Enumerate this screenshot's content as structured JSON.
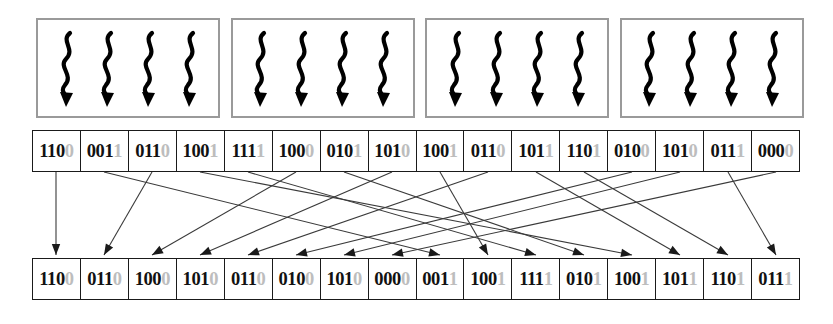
{
  "diagram": {
    "colors": {
      "cell_border": "#1a1a1a",
      "channel_box_border": "#9a9a9a",
      "bit_text": "#111111",
      "faint_bit_text": "#bdbdbd",
      "arrow": "#3a3a3a",
      "background": "#ffffff"
    },
    "channel_boxes": {
      "count": 4,
      "squiggles_per_box": 4,
      "icon": "squiggly-down-arrow-icon"
    },
    "input_row": {
      "label": "input codeword row",
      "cells": [
        "1100",
        "0011",
        "0110",
        "1001",
        "1111",
        "1000",
        "0101",
        "1010",
        "1001",
        "0110",
        "1011",
        "1101",
        "0100",
        "1010",
        "0111",
        "0000"
      ]
    },
    "output_row": {
      "label": "interleaved output row",
      "cells": [
        "1100",
        "0110",
        "1000",
        "1010",
        "0110",
        "0100",
        "1010",
        "0000",
        "0011",
        "1001",
        "1111",
        "0101",
        "1001",
        "1011",
        "1101",
        "0111"
      ]
    },
    "mapping": {
      "label": "source index to destination index",
      "pairs": [
        [
          0,
          0
        ],
        [
          1,
          8
        ],
        [
          2,
          1
        ],
        [
          3,
          12
        ],
        [
          4,
          10
        ],
        [
          5,
          2
        ],
        [
          6,
          11
        ],
        [
          7,
          3
        ],
        [
          8,
          9
        ],
        [
          9,
          4
        ],
        [
          10,
          13
        ],
        [
          11,
          14
        ],
        [
          12,
          5
        ],
        [
          13,
          6
        ],
        [
          14,
          15
        ],
        [
          15,
          7
        ]
      ]
    }
  }
}
